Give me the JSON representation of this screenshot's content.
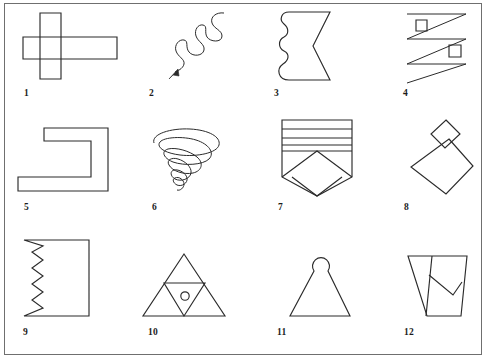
{
  "sheet": {
    "title": "Figure copying test sheet",
    "background_color": "#ffffff",
    "ink_color": "#2b2b2b",
    "border_color": "#6f6f6f",
    "columns": 4,
    "rows": 3,
    "item_count": 12
  },
  "figures": [
    {
      "number": "1",
      "name": "overlapping-rectangles-cross",
      "description": "Tall narrow vertical rectangle crossed by a long horizontal rectangle forming an outlined cross"
    },
    {
      "number": "2",
      "name": "wavy-line-with-arrow",
      "description": "Sinuous wavy line running from upper right down to lower left ending in an arrowhead"
    },
    {
      "number": "3",
      "name": "wavy-left-chevron-right-shape",
      "description": "Closed shape with three rounded bumps along the left edge and an inward pointing chevron notch on the right"
    },
    {
      "number": "4",
      "name": "zigzag-with-two-squares",
      "description": "Three-stroke zigzag (Z pattern) with a small square near the top left and a small square near the middle right"
    },
    {
      "number": "5",
      "name": "bracket-c-shape",
      "description": "Thick outlined C or bracket shape opening to the left"
    },
    {
      "number": "6",
      "name": "conical-spiral",
      "description": "Tornado-like conical spiral, wide loops at the top narrowing to small loops at the bottom"
    },
    {
      "number": "7",
      "name": "striped-shield-with-chevron",
      "description": "Shield shape with four horizontal stripes across the top and a large chevron pointing down inside the lower half"
    },
    {
      "number": "8",
      "name": "stacked-diamonds",
      "description": "Small diamond resting point to point on top of a larger diamond, slightly overlapping"
    },
    {
      "number": "9",
      "name": "rectangle-with-sawtooth-edge",
      "description": "Rectangle whose left edge is a sharp zigzag sawtooth"
    },
    {
      "number": "10",
      "name": "triangle-with-inverted-triangle-and-circle",
      "description": "Large triangle containing an inverted inner triangle with a small circle inside it"
    },
    {
      "number": "11",
      "name": "triangle-with-circle-finial",
      "description": "Triangle topped by a small circle, resembling a pawn or bell"
    },
    {
      "number": "12",
      "name": "inverted-trapezoid-divided",
      "description": "Inverted trapezoid divided by internal lines into a triangle and a quadrilateral"
    }
  ]
}
